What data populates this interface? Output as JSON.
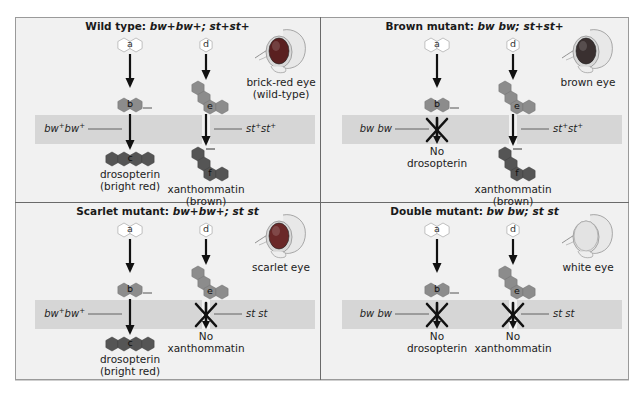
{
  "figure": {
    "colors": {
      "panel_bg": "#f1f1f1",
      "band": "#d6d6d6",
      "hex_light": "#8c8c8c",
      "hex_dark": "#555555",
      "hex_precursor": "#ffffff",
      "arrow": "#111111",
      "eye_red": "#5a2020",
      "eye_brown": "#3a3030",
      "eye_scarlet": "#6a2828",
      "eye_white": "#e3e3e3"
    },
    "panels": [
      {
        "id": "wild-type",
        "title_prefix": "Wild type: ",
        "genotype_bw": "bw",
        "genotype_bw_sup": "+",
        "genotype_st": "st",
        "genotype_st_sup": "+",
        "title_text": "Wild type: bw+bw+; st+st+",
        "gene_left": "bw+bw+",
        "gene_left_base": "bw",
        "gene_left_sup": "+",
        "gene_right": "st+st+",
        "gene_right_base": "st",
        "gene_right_sup": "+",
        "left_blocked": false,
        "right_blocked": false,
        "left_product_line1": "drosopterin",
        "left_product_line2": "(bright red)",
        "right_product_line1": "xanthommatin",
        "right_product_line2": "(brown)",
        "eye_label_line1": "brick-red eye",
        "eye_label_line2": "(wild-type)",
        "eye_color": "eye_red"
      },
      {
        "id": "brown-mutant",
        "title_prefix": "Brown mutant: ",
        "title_text": "Brown mutant: bw bw; st+st+",
        "gene_left": "bw bw",
        "gene_left_base": "bw bw",
        "gene_left_sup": "",
        "gene_right": "st+st+",
        "gene_right_base": "st",
        "gene_right_sup": "+",
        "left_blocked": true,
        "right_blocked": false,
        "left_product_line1": "No",
        "left_product_line2": "drosopterin",
        "right_product_line1": "xanthommatin",
        "right_product_line2": "(brown)",
        "eye_label_line1": "brown eye",
        "eye_label_line2": "",
        "eye_color": "eye_brown"
      },
      {
        "id": "scarlet-mutant",
        "title_prefix": "Scarlet mutant: ",
        "title_text": "Scarlet mutant: bw+bw+; st st",
        "gene_left": "bw+bw+",
        "gene_left_base": "bw",
        "gene_left_sup": "+",
        "gene_right": "st st",
        "gene_right_base": "st st",
        "gene_right_sup": "",
        "left_blocked": false,
        "right_blocked": true,
        "left_product_line1": "drosopterin",
        "left_product_line2": "(bright red)",
        "right_product_line1": "No",
        "right_product_line2": "xanthommatin",
        "eye_label_line1": "scarlet eye",
        "eye_label_line2": "",
        "eye_color": "eye_scarlet"
      },
      {
        "id": "double-mutant",
        "title_prefix": "Double mutant: ",
        "title_text": "Double mutant: bw bw; st st",
        "gene_left": "bw bw",
        "gene_left_base": "bw bw",
        "gene_left_sup": "",
        "gene_right": "st st",
        "gene_right_base": "st st",
        "gene_right_sup": "",
        "left_blocked": true,
        "right_blocked": true,
        "left_product_line1": "No",
        "left_product_line2": "drosopterin",
        "right_product_line1": "No",
        "right_product_line2": "xanthommatin",
        "eye_label_line1": "white eye",
        "eye_label_line2": "",
        "eye_color": "eye_white"
      }
    ],
    "molecule_labels": {
      "a": "a",
      "b": "b",
      "c": "c",
      "d": "d",
      "e": "e",
      "f": "f"
    }
  }
}
